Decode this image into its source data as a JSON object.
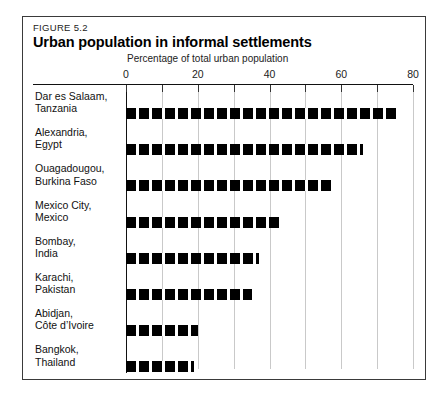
{
  "figure": {
    "number": "FIGURE 5.2",
    "title": "Urban population in informal settlements",
    "axis_caption": "Percentage of total urban population"
  },
  "chart_data": {
    "type": "bar",
    "orientation": "horizontal",
    "title": "Urban population in informal settlements",
    "subtitle": "FIGURE 5.2",
    "xlabel": "Percentage of total urban population",
    "ylabel": "",
    "xlim": [
      0,
      80
    ],
    "major_ticks": [
      0,
      20,
      40,
      60,
      80
    ],
    "minor_ticks": [
      10,
      30,
      50,
      70
    ],
    "tick_labels": [
      "0",
      "20",
      "40",
      "60",
      "80"
    ],
    "grid": "vertical-every-10",
    "legend": "none",
    "bar_style": "dashed-black-segments",
    "categories": [
      "Dar es Salaam, Tanzania",
      "Alexandria, Egypt",
      "Ouagadougou, Burkina Faso",
      "Mexico City, Mexico",
      "Bombay, India",
      "Karachi, Pakistan",
      "Abidjan, Côte d’Ivoire",
      "Bangkok, Thailand"
    ],
    "values": [
      76,
      66,
      58,
      43,
      37,
      35,
      20,
      19
    ],
    "rows": [
      {
        "city": "Dar es Salaam,",
        "country": "Tanzania",
        "value": 76
      },
      {
        "city": "Alexandria,",
        "country": "Egypt",
        "value": 66
      },
      {
        "city": "Ouagadougou,",
        "country": "Burkina Faso",
        "value": 58
      },
      {
        "city": "Mexico City,",
        "country": "Mexico",
        "value": 43
      },
      {
        "city": "Bombay,",
        "country": "India",
        "value": 37
      },
      {
        "city": "Karachi,",
        "country": "Pakistan",
        "value": 35
      },
      {
        "city": "Abidjan,",
        "country": "Côte d’Ivoire",
        "value": 20
      },
      {
        "city": "Bangkok,",
        "country": "Thailand",
        "value": 19
      }
    ]
  },
  "colors": {
    "bar": "#000000",
    "gridline": "#c9c9c9",
    "axis": "#111111",
    "frame": "#3a3a3a",
    "background": "#ffffff"
  }
}
